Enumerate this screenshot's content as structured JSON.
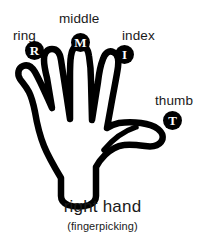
{
  "diagram": {
    "caption_main": "right hand",
    "caption_sub": "(fingerpicking)",
    "background_color": "#ffffff",
    "ink_color": "#000000",
    "text_color": "#1a1a1a"
  },
  "fingers": [
    {
      "id": "ring",
      "label": "ring",
      "marker_letter": "R",
      "label_x": 13,
      "label_y": 29,
      "marker_x": 25,
      "marker_y": 41
    },
    {
      "id": "middle",
      "label": "middle",
      "marker_letter": "M",
      "label_x": 59,
      "label_y": 12,
      "marker_x": 71,
      "marker_y": 33
    },
    {
      "id": "index",
      "label": "index",
      "marker_letter": "I",
      "label_x": 122,
      "label_y": 29,
      "marker_x": 115,
      "marker_y": 45
    },
    {
      "id": "thumb",
      "label": "thumb",
      "marker_letter": "T",
      "label_x": 155,
      "label_y": 94,
      "marker_x": 163,
      "marker_y": 111
    }
  ],
  "caption": {
    "block_top": 198
  }
}
